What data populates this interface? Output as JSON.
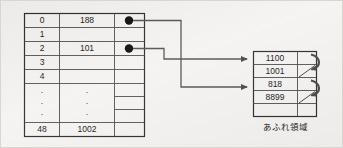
{
  "figure": {
    "background_color": "#f4f3f1",
    "border_color": "#d8d6d2"
  },
  "bucket_table": {
    "name": "bucket-table",
    "columns": [
      "index",
      "key",
      "pointer"
    ],
    "rows": [
      {
        "index": "0",
        "key": "188",
        "pointer": "filled-dot"
      },
      {
        "index": "1",
        "key": "",
        "pointer": ""
      },
      {
        "index": "2",
        "key": "101",
        "pointer": "filled-dot"
      },
      {
        "index": "3",
        "key": "",
        "pointer": ""
      },
      {
        "index": "4",
        "key": "",
        "pointer": ""
      },
      {
        "index": "·",
        "key": "·",
        "pointer": ""
      },
      {
        "index": "·",
        "key": "·",
        "pointer": ""
      },
      {
        "index": "·",
        "key": "·",
        "pointer": ""
      },
      {
        "index": "48",
        "key": "1002",
        "pointer": ""
      }
    ]
  },
  "overflow_table": {
    "name": "overflow-area-table",
    "caption": "あふれ領域",
    "rows": [
      {
        "key": "1100",
        "pointer": "chain-to-next"
      },
      {
        "key": "1001",
        "pointer": "end"
      },
      {
        "key": "818",
        "pointer": "chain-to-next"
      },
      {
        "key": "8899",
        "pointer": "end"
      },
      {
        "key": "",
        "pointer": ""
      }
    ]
  },
  "links": [
    {
      "from": "bucket-row-0-pointer",
      "to": "overflow-row-3",
      "label": ""
    },
    {
      "from": "bucket-row-2-pointer",
      "to": "overflow-row-1",
      "label": ""
    }
  ],
  "colors": {
    "line": "#4a4a4a",
    "link": "#555555",
    "dot": "#111111",
    "text": "#1a1a1a"
  }
}
